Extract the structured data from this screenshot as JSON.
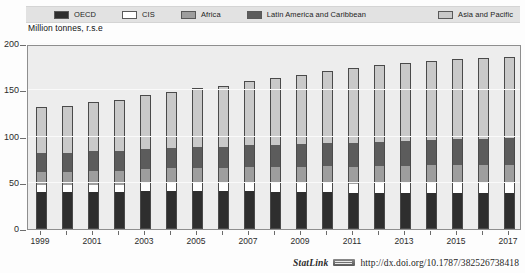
{
  "title_partial": "",
  "subtitle": "Million tonnes, r.s.e",
  "legend": {
    "items": [
      {
        "label": "OECD",
        "color": "#2e2e2e"
      },
      {
        "label": "CIS",
        "color": "#ffffff"
      },
      {
        "label": "Africa",
        "color": "#9e9e9e"
      },
      {
        "label": "Latin America and Caribbean",
        "color": "#5c5c5c"
      },
      {
        "label": "Asia and Pacific",
        "color": "#c9c9c9"
      }
    ]
  },
  "footer": {
    "statlink_label": "StatLink",
    "statlink_icon": "barcode-icon",
    "doi_url": "http://dx.doi.org/10.1787/382526738418"
  },
  "chart_data": {
    "type": "bar",
    "stacked": true,
    "title": "Million tonnes, r.s.e",
    "xlabel": "",
    "ylabel": "Million tonnes, r.s.e",
    "ylim": [
      0,
      200
    ],
    "yticks": [
      0,
      50,
      100,
      150,
      200
    ],
    "ytick_labels": [
      "0",
      "50",
      "100",
      "150",
      "200"
    ],
    "grid": true,
    "legend_position": "top",
    "categories": [
      "1999",
      "2000",
      "2001",
      "2002",
      "2003",
      "2004",
      "2005",
      "2006",
      "2007",
      "2008",
      "2009",
      "2010",
      "2011",
      "2012",
      "2013",
      "2014",
      "2015",
      "2016",
      "2017"
    ],
    "xtick_labels": [
      "1999",
      "",
      "2001",
      "",
      "2003",
      "",
      "2005",
      "",
      "2007",
      "",
      "2009",
      "",
      "2011",
      "",
      "2013",
      "",
      "2015",
      "",
      "2017"
    ],
    "series": [
      {
        "name": "OECD",
        "color": "#2e2e2e",
        "values": [
          40,
          40,
          40,
          40,
          41,
          41,
          41,
          41,
          41,
          40,
          40,
          40,
          39,
          39,
          39,
          39,
          39,
          39,
          39
        ]
      },
      {
        "name": "CIS",
        "color": "#ffffff",
        "values": [
          8,
          8,
          8,
          8,
          9,
          9,
          9,
          9,
          9,
          10,
          10,
          10,
          10,
          11,
          11,
          11,
          11,
          11,
          11
        ]
      },
      {
        "name": "Africa",
        "color": "#9e9e9e",
        "values": [
          14,
          14,
          15,
          15,
          15,
          16,
          16,
          16,
          17,
          17,
          17,
          18,
          18,
          18,
          18,
          19,
          19,
          19,
          19
        ]
      },
      {
        "name": "Latin America and Caribbean",
        "color": "#5c5c5c",
        "values": [
          20,
          20,
          21,
          21,
          22,
          22,
          23,
          23,
          24,
          24,
          25,
          25,
          26,
          26,
          27,
          27,
          28,
          28,
          29
        ]
      },
      {
        "name": "Asia and Pacific",
        "color": "#c9c9c9",
        "values": [
          50,
          51,
          53,
          55,
          58,
          60,
          63,
          66,
          69,
          72,
          75,
          78,
          81,
          83,
          85,
          86,
          87,
          88,
          88
        ]
      }
    ],
    "totals": [
      132,
      133,
      137,
      139,
      145,
      148,
      152,
      155,
      160,
      163,
      167,
      171,
      174,
      177,
      180,
      182,
      184,
      185,
      186
    ]
  }
}
